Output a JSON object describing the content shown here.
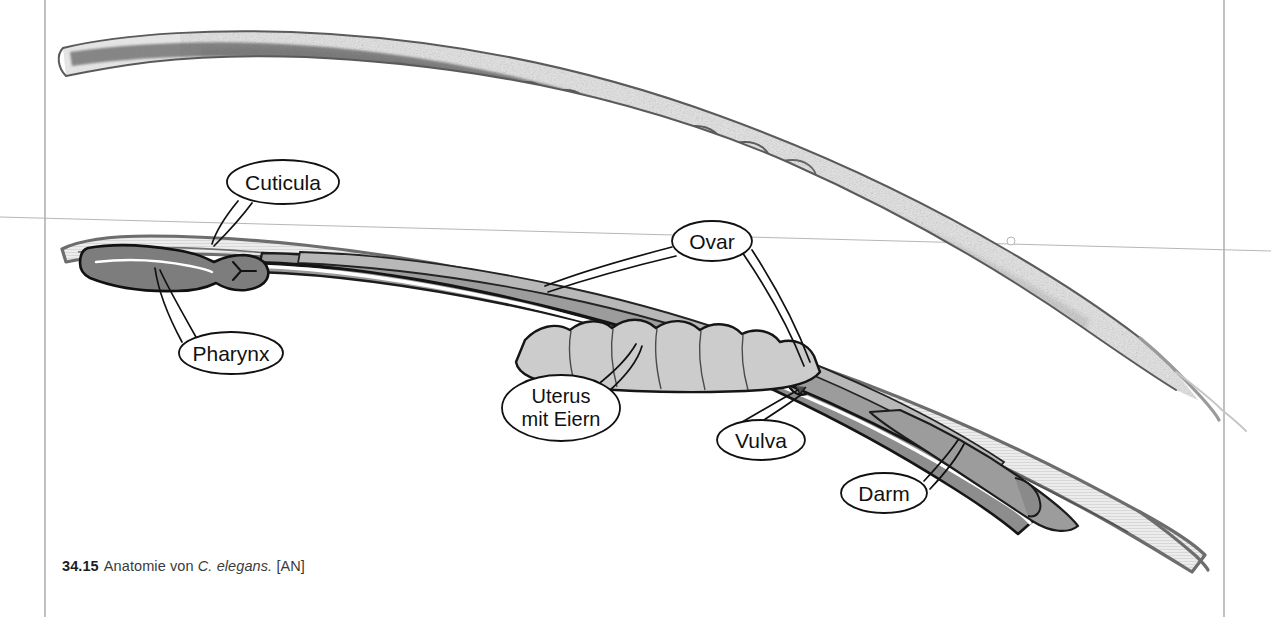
{
  "page": {
    "width": 1271,
    "height": 617,
    "background": "#ffffff",
    "rules": {
      "left_border_x": 45,
      "right_border_x": 1224,
      "horizontal_rule_y": 218,
      "rule_color": "#8a8a8a"
    }
  },
  "figure": {
    "number": "34.15",
    "caption_text": "Anatomie von",
    "species": "C. elegans.",
    "source": "[AN]",
    "panels": [
      {
        "name": "photomicrograph",
        "description": "Lichtmikroskopische Aufnahme eines C. elegans Hermaphroditen in Seitenansicht, Kopf links, Schwanz rechts unten",
        "type": "grayscale-micrograph"
      },
      {
        "name": "schematic-diagram",
        "description": "Schematische Strichzeichnung derselben Tieres mit beschrifteten Organen",
        "type": "line-drawing"
      }
    ]
  },
  "labels": [
    {
      "id": "cuticula",
      "text": "Cuticula",
      "lines": [
        "Cuticula"
      ],
      "cx": 283,
      "cy": 182,
      "rx": 56,
      "ry": 22
    },
    {
      "id": "pharynx",
      "text": "Pharynx",
      "lines": [
        "Pharynx"
      ],
      "cx": 231,
      "cy": 353,
      "rx": 52,
      "ry": 21
    },
    {
      "id": "ovar",
      "text": "Ovar",
      "lines": [
        "Ovar"
      ],
      "cx": 712,
      "cy": 241,
      "rx": 40,
      "ry": 20
    },
    {
      "id": "uterus",
      "text": "Uterus mit Eiern",
      "lines": [
        "Uterus",
        "mit Eiern"
      ],
      "cx": 561,
      "cy": 408,
      "rx": 58,
      "ry": 32
    },
    {
      "id": "vulva",
      "text": "Vulva",
      "lines": [
        "Vulva"
      ],
      "cx": 761,
      "cy": 440,
      "rx": 44,
      "ry": 20
    },
    {
      "id": "darm",
      "text": "Darm",
      "lines": [
        "Darm"
      ],
      "cx": 884,
      "cy": 493,
      "rx": 43,
      "ry": 20
    }
  ],
  "colors": {
    "body_light": "#e6e6e6",
    "body_mid": "#a0a0a0",
    "body_dark": "#8c8c8c",
    "outline": "#1a1a1a",
    "lumen": "#ffffff",
    "micrograph_ink": "#6f6f6f",
    "rule": "#8f8f8f",
    "text": "#111111",
    "caption_text": "#3b3b3b"
  }
}
